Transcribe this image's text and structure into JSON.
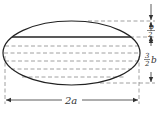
{
  "diagram": {
    "title": "",
    "shape": "ellipse-cross-section-partially-filled",
    "colors": {
      "stroke": "#333333",
      "dashed": "#888888",
      "background": "#ffffff"
    },
    "labels": {
      "width": "2a",
      "top_gap_num": "b",
      "top_gap_den": "2",
      "depth_num": "3",
      "depth_den": "2",
      "depth_var": "b"
    }
  }
}
